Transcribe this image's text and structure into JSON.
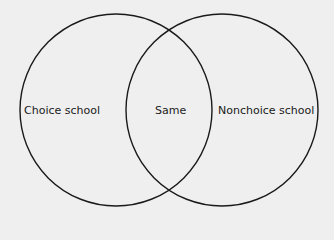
{
  "diagram": {
    "type": "venn",
    "background": "#efefef",
    "stroke_color": "#1a1a1a",
    "sets": [
      {
        "id": "left",
        "label": "Choice school",
        "cx": 116,
        "cy": 110,
        "r": 96
      },
      {
        "id": "right",
        "label": "Nonchoice school",
        "cx": 222,
        "cy": 110,
        "r": 96
      }
    ],
    "intersection_label": "Same"
  }
}
